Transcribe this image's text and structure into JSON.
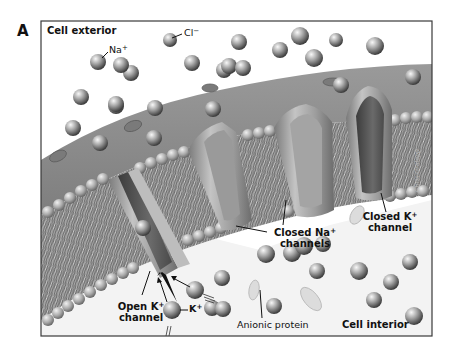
{
  "figure": {
    "panel_letter": "A",
    "frame": {
      "x": 41,
      "y": 21,
      "width": 391,
      "height": 315,
      "stroke": "#3a3a3a"
    },
    "colors": {
      "background": "#ffffff",
      "exterior_fluid": "#ffffff",
      "membrane_surface": "#8f8f8f",
      "membrane_cut": "#6f6f6f",
      "lipid_head": "#b8b8b8",
      "lipid_tail": "#d9d9d9",
      "channel_wall": "#a9a9a9",
      "channel_pore": "#555555",
      "ion_light": "#eeeeee",
      "ion_dark": "#555555",
      "interior_fluid": "#f4f4f4",
      "text": "#111111"
    }
  },
  "labels": {
    "cell_exterior": "Cell exterior",
    "na_ion": {
      "base": "Na",
      "sup": "+"
    },
    "cl_ion": {
      "base": "Cl",
      "sup": "−"
    },
    "k_ion": {
      "base": "K",
      "sup": "+"
    },
    "closed_na": {
      "line1_base": "Closed Na",
      "line1_sup": "+",
      "line2": "channels"
    },
    "closed_k": {
      "line1_base": "Closed K",
      "line1_sup": "+",
      "line2": "channel"
    },
    "open_k": {
      "line1_base": "Open K",
      "line1_sup": "+",
      "line2": "channel"
    },
    "anionic_protein": "Anionic protein",
    "cell_interior": "Cell interior",
    "signature": "Chris Gralapp"
  },
  "ions": {
    "exterior": [
      {
        "x": 98,
        "y": 62,
        "r": 8
      },
      {
        "x": 131,
        "y": 73,
        "r": 8
      },
      {
        "x": 170,
        "y": 40,
        "r": 7
      },
      {
        "x": 192,
        "y": 63,
        "r": 8
      },
      {
        "x": 239,
        "y": 42,
        "r": 8
      },
      {
        "x": 300,
        "y": 36,
        "r": 9
      },
      {
        "x": 336,
        "y": 40,
        "r": 7
      },
      {
        "x": 375,
        "y": 46,
        "r": 9
      },
      {
        "x": 280,
        "y": 50,
        "r": 8
      },
      {
        "x": 81,
        "y": 97,
        "r": 8
      },
      {
        "x": 116,
        "y": 106,
        "r": 8
      },
      {
        "x": 121,
        "y": 65,
        "r": 8
      },
      {
        "x": 224,
        "y": 70,
        "r": 8
      },
      {
        "x": 314,
        "y": 58,
        "r": 9
      },
      {
        "x": 229,
        "y": 66,
        "r": 8
      },
      {
        "x": 72,
        "y": 37,
        "r": 0
      }
    ],
    "on_membrane": [
      {
        "x": 116,
        "y": 104,
        "r": 8
      },
      {
        "x": 155,
        "y": 108,
        "r": 8
      },
      {
        "x": 73,
        "y": 128,
        "r": 8
      },
      {
        "x": 100,
        "y": 143,
        "r": 8
      },
      {
        "x": 154,
        "y": 138,
        "r": 8
      },
      {
        "x": 213,
        "y": 109,
        "r": 8
      },
      {
        "x": 341,
        "y": 85,
        "r": 8
      },
      {
        "x": 413,
        "y": 77,
        "r": 8
      },
      {
        "x": 243,
        "y": 68,
        "r": 8
      }
    ],
    "interior": [
      {
        "x": 143,
        "y": 228,
        "r": 8
      },
      {
        "x": 266,
        "y": 254,
        "r": 9
      },
      {
        "x": 292,
        "y": 253,
        "r": 9
      },
      {
        "x": 317,
        "y": 271,
        "r": 8
      },
      {
        "x": 323,
        "y": 244,
        "r": 8
      },
      {
        "x": 359,
        "y": 271,
        "r": 9
      },
      {
        "x": 391,
        "y": 282,
        "r": 8
      },
      {
        "x": 410,
        "y": 262,
        "r": 8
      },
      {
        "x": 374,
        "y": 300,
        "r": 8
      },
      {
        "x": 414,
        "y": 316,
        "r": 9
      },
      {
        "x": 222,
        "y": 278,
        "r": 8
      },
      {
        "x": 212,
        "y": 308,
        "r": 8
      },
      {
        "x": 274,
        "y": 306,
        "r": 8
      },
      {
        "x": 304,
        "y": 246,
        "r": 9
      },
      {
        "x": 195,
        "y": 290,
        "r": 9
      },
      {
        "x": 223,
        "y": 309,
        "r": 8
      }
    ],
    "k_open": {
      "x": 172,
      "y": 310,
      "r": 9
    }
  }
}
